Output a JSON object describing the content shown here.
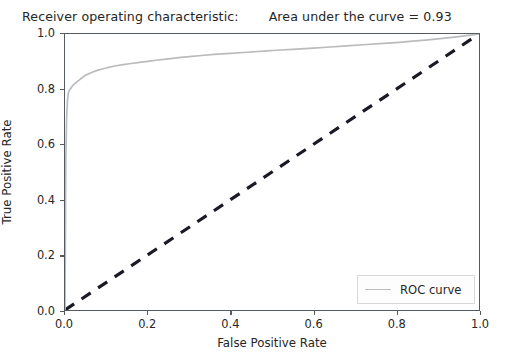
{
  "chart_data": {
    "type": "line",
    "title": "Receiver operating characteristic:",
    "annotation": "Area under the curve = 0.93",
    "auc": 0.93,
    "xlabel": "False Positive Rate",
    "ylabel": "True Positive Rate",
    "xlim": [
      0.0,
      1.0
    ],
    "ylim": [
      0.0,
      1.0
    ],
    "grid": false,
    "legend_position": "lower right",
    "xticks": [
      "0.0",
      "0.2",
      "0.4",
      "0.6",
      "0.8",
      "1.0"
    ],
    "xtick_values": [
      0.0,
      0.2,
      0.4,
      0.6,
      0.8,
      1.0
    ],
    "yticks": [
      "0.0",
      "0.2",
      "0.4",
      "0.6",
      "0.8",
      "1.0"
    ],
    "ytick_values": [
      0.0,
      0.2,
      0.4,
      0.6,
      0.8,
      1.0
    ],
    "series": [
      {
        "name": "ROC curve",
        "color": "#b9bbbd",
        "linestyle": "solid",
        "x": [
          0.0,
          0.002,
          0.004,
          0.006,
          0.008,
          0.01,
          0.012,
          0.015,
          0.018,
          0.022,
          0.026,
          0.03,
          0.035,
          0.04,
          0.045,
          0.05,
          0.06,
          0.07,
          0.08,
          0.09,
          0.1,
          0.12,
          0.14,
          0.16,
          0.18,
          0.2,
          0.22,
          0.25,
          0.28,
          0.3,
          0.33,
          0.36,
          0.4,
          0.44,
          0.48,
          0.52,
          0.56,
          0.6,
          0.64,
          0.68,
          0.72,
          0.76,
          0.8,
          0.84,
          0.87,
          0.9,
          0.93,
          0.96,
          0.98,
          1.0
        ],
        "y": [
          0.0,
          0.55,
          0.7,
          0.76,
          0.785,
          0.795,
          0.8,
          0.805,
          0.812,
          0.818,
          0.823,
          0.828,
          0.834,
          0.84,
          0.846,
          0.851,
          0.858,
          0.864,
          0.869,
          0.873,
          0.877,
          0.884,
          0.889,
          0.893,
          0.897,
          0.901,
          0.905,
          0.91,
          0.915,
          0.918,
          0.922,
          0.926,
          0.93,
          0.934,
          0.938,
          0.942,
          0.945,
          0.949,
          0.953,
          0.957,
          0.961,
          0.965,
          0.969,
          0.974,
          0.978,
          0.982,
          0.987,
          0.992,
          0.996,
          1.0
        ]
      },
      {
        "name": "chance",
        "color": "#1a1a26",
        "linestyle": "dashed",
        "x": [
          0.0,
          1.0
        ],
        "y": [
          0.0,
          1.0
        ]
      }
    ]
  },
  "legend": {
    "entries": [
      {
        "label": "ROC curve",
        "color": "#b9bbbd"
      }
    ]
  },
  "colors": {
    "roc_curve": "#b9bbbd",
    "chance_line": "#1a1a26",
    "axis": "#555a5e",
    "text": "#262626",
    "background": "#ffffff"
  }
}
